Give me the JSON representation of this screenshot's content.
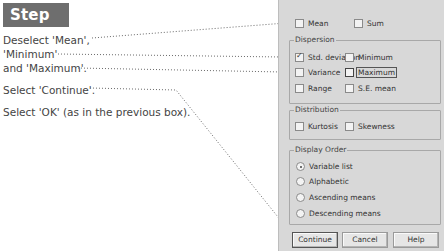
{
  "step": {
    "label": "Step 3:"
  },
  "instructions": [
    "Deselect 'Mean',",
    "'Minimum'",
    "and 'Maximum'.",
    "Select 'Continue'.",
    "Select 'OK' (as in the previous box)."
  ],
  "dialog": {
    "top_options": [
      {
        "label": "Mean",
        "mnemonic": "M",
        "checked": false
      },
      {
        "label": "Sum",
        "mnemonic": "S",
        "checked": false
      }
    ],
    "dispersion": {
      "title": "Dispersion",
      "options": [
        {
          "label": "Std. deviation",
          "checked": true
        },
        {
          "label": "Minimum",
          "checked": false
        },
        {
          "label": "Variance",
          "checked": false
        },
        {
          "label": "Maximum",
          "checked": false,
          "focused": true
        },
        {
          "label": "Range",
          "checked": false
        },
        {
          "label": "S.E. mean",
          "checked": false
        }
      ]
    },
    "distribution": {
      "title": "Distribution",
      "options": [
        {
          "label": "Kurtosis",
          "checked": false
        },
        {
          "label": "Skewness",
          "checked": false
        }
      ]
    },
    "display_order": {
      "title": "Display Order",
      "options": [
        {
          "label": "Variable list",
          "selected": true
        },
        {
          "label": "Alphabetic",
          "selected": false
        },
        {
          "label": "Ascending means",
          "selected": false
        },
        {
          "label": "Descending means",
          "selected": false
        }
      ]
    },
    "buttons": {
      "continue": "Continue",
      "cancel": "Cancel",
      "help": "Help"
    }
  }
}
